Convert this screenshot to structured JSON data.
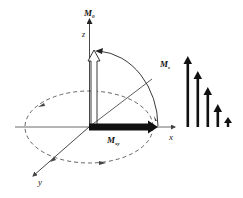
{
  "diagram": {
    "type": "vector diagram",
    "axes": {
      "z": {
        "label": "z"
      },
      "x": {
        "label": "x"
      },
      "y": {
        "label": "y"
      }
    },
    "vectors": {
      "m0": {
        "label_main": "M",
        "label_sub": "0"
      },
      "mz": {
        "label_main": "M",
        "label_sub": "z"
      },
      "mxy": {
        "label_main": "M",
        "label_sub": "xy"
      }
    },
    "decay_bars": {
      "count": 5,
      "relative_heights": [
        70,
        55,
        39,
        22,
        9
      ]
    },
    "colors": {
      "line": "#333333",
      "vector": "#111111",
      "dashed": "#555555",
      "background": "#ffffff"
    }
  }
}
